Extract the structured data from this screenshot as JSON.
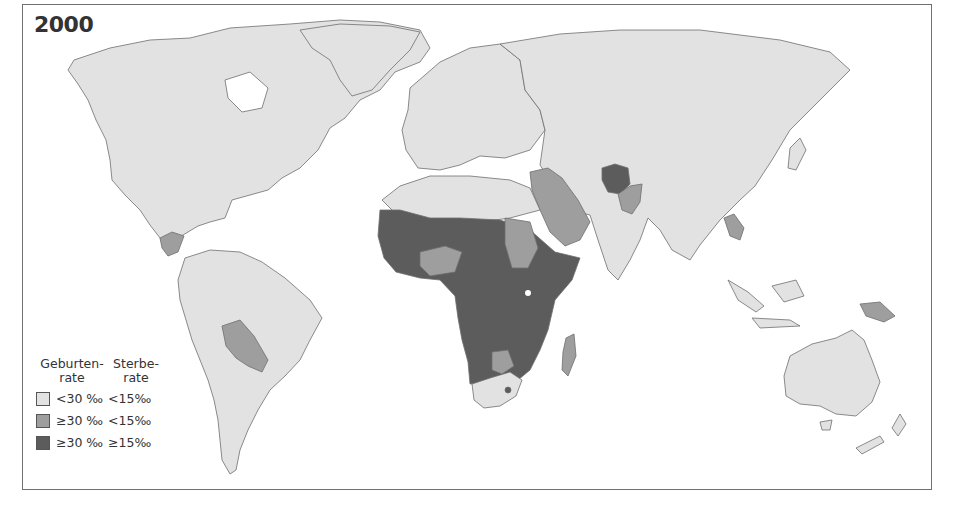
{
  "map": {
    "title": "2000",
    "colors": {
      "low": "#e2e2e2",
      "medium": "#9e9e9e",
      "high": "#5c5c5c",
      "border": "#6e6e6e",
      "water": "#ffffff"
    }
  },
  "legend": {
    "header_birth": "Geburten-\nrate",
    "header_birth_l1": "Geburten-",
    "header_birth_l2": "rate",
    "header_death_l1": "Sterbe-",
    "header_death_l2": "rate",
    "rows": [
      {
        "category": "low",
        "birth": "<30 ‰",
        "death": "<15‰",
        "color": "#e2e2e2"
      },
      {
        "category": "medium",
        "birth": "≥30 ‰",
        "death": "<15‰",
        "color": "#9e9e9e"
      },
      {
        "category": "high",
        "birth": "≥30 ‰",
        "death": "≥15‰",
        "color": "#5c5c5c"
      }
    ]
  }
}
